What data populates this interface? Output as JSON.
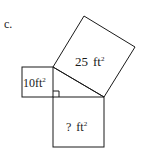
{
  "problem_label": "c.",
  "squares": {
    "leg_a": {
      "area_value": "10",
      "unit": "ft",
      "exponent": "2"
    },
    "hypotenuse": {
      "area_value": "25",
      "unit": "ft",
      "exponent": "2"
    },
    "leg_b": {
      "area_value": "?",
      "unit": "ft",
      "exponent": "2"
    }
  },
  "colors": {
    "stroke": "#1a1a1a",
    "background": "#ffffff"
  }
}
